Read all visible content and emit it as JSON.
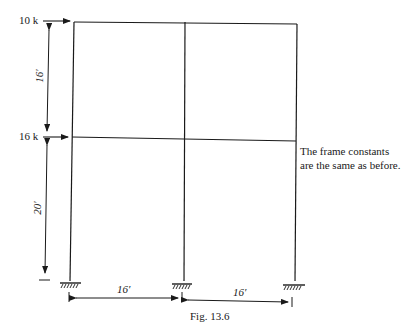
{
  "figure": {
    "caption": "Fig. 13.6",
    "loads": [
      {
        "label": "10 k",
        "level": "roof"
      },
      {
        "label": "16 k",
        "level": "floor"
      }
    ],
    "story_heights": [
      {
        "label": "16′",
        "story": "upper"
      },
      {
        "label": "20′",
        "story": "lower"
      }
    ],
    "bay_widths": [
      {
        "label": "16′",
        "bay": "left"
      },
      {
        "label": "16′",
        "bay": "right"
      }
    ],
    "note_lines": [
      "The frame constants",
      "are the same as before."
    ],
    "supports": [
      "fixed-support",
      "fixed-support",
      "fixed-support"
    ],
    "line_color": "#1a1a1a"
  }
}
